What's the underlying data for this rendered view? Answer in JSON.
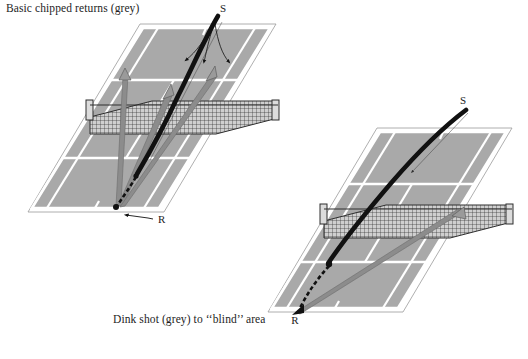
{
  "figure": {
    "type": "tennis-tactics-diagram",
    "background_color": "#ffffff",
    "court_surface_color": "#a9a9a9",
    "court_line_color": "#ffffff",
    "court_outline_color": "#8f8f8f",
    "shot_black_color": "#111111",
    "shot_grey_color": "#7d7d7d",
    "net_color": "#3a3a3a"
  },
  "captions": {
    "top": "Basic chipped returns (grey)",
    "bottom": "Dink shot (grey) to ‘‘blind’’ area"
  },
  "diagrams": [
    {
      "id": "court-top-left",
      "caption_ref": "top",
      "labels": [
        {
          "name": "server-label",
          "text": "S",
          "x": 223,
          "y": 12
        },
        {
          "name": "receiver-label",
          "text": "R",
          "x": 158,
          "y": 221
        }
      ],
      "shots": [
        {
          "name": "serve-trajectory",
          "style": "black-thick-curve",
          "color": "#111111",
          "description": "Serve from S curving down across the net to the receiver"
        },
        {
          "name": "return-bounce-path",
          "style": "black-dashed",
          "color": "#111111",
          "description": "Dashed bounce path at receiver position"
        },
        {
          "name": "chipped-return-cross",
          "style": "grey-tapered-arrow",
          "color": "#7d7d7d",
          "description": "Chipped return to crosscourt side"
        },
        {
          "name": "chipped-return-middle",
          "style": "grey-tapered-arrow",
          "color": "#7d7d7d",
          "description": "Chipped return down the middle"
        },
        {
          "name": "chipped-return-line",
          "style": "grey-tapered-arrow",
          "color": "#7d7d7d",
          "description": "Chipped return down the line"
        },
        {
          "name": "server-movement-arrows",
          "style": "thin-black-arrows",
          "color": "#111111",
          "count": 3,
          "description": "Three thin arrows from server position showing coverage directions"
        },
        {
          "name": "receiver-movement-arrow",
          "style": "thin-black-arrow",
          "color": "#111111",
          "description": "Small arrow at R pointing left"
        }
      ]
    },
    {
      "id": "court-bottom-right",
      "caption_ref": "bottom",
      "labels": [
        {
          "name": "server-label",
          "text": "S",
          "x": 463,
          "y": 103
        },
        {
          "name": "receiver-label",
          "text": "R",
          "x": 295,
          "y": 317
        }
      ],
      "shots": [
        {
          "name": "serve-trajectory",
          "style": "black-thick-curve",
          "color": "#111111",
          "description": "Serve from S curving across the net to the receiver"
        },
        {
          "name": "return-bounce-path",
          "style": "black-dashed",
          "color": "#111111",
          "description": "Dashed bounce path at receiver position"
        },
        {
          "name": "dink-shot",
          "style": "grey-tapered-arrow",
          "color": "#7d7d7d",
          "description": "Dink shot from R to the blind area deep crosscourt"
        },
        {
          "name": "server-movement-arrow",
          "style": "thin-black-arrow",
          "color": "#111111",
          "description": "Thin arrow from S toward service box"
        }
      ]
    }
  ]
}
